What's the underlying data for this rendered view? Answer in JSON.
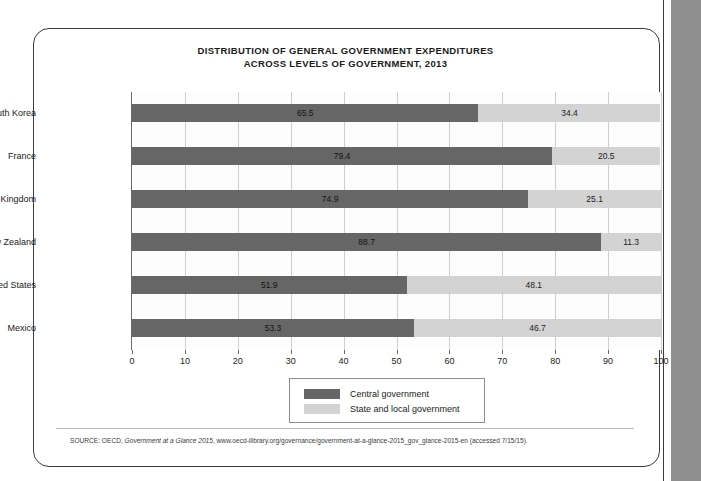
{
  "figure": {
    "title_line1": "DISTRIBUTION OF GENERAL GOVERNMENT EXPENDITURES",
    "title_line2": "ACROSS LEVELS OF GOVERNMENT, 2013",
    "source_prefix": "SOURCE: OECD, ",
    "source_italic": "Government at a Glance 2015",
    "source_rest": ", www.oecd-ilibrary.org/governance/government-at-a-glance-2015_gov_glance-2015-en (accessed 7/15/15)."
  },
  "colors": {
    "central": "#666666",
    "state_local": "#d3d3d3",
    "frame": "#3c3c3c",
    "axis": "#6a6a6a",
    "grid": "#cfcfcf",
    "page_edge": "#8f8f8f"
  },
  "legend": {
    "items": [
      {
        "label": "Central government",
        "swatch": "dark"
      },
      {
        "label": "State and local government",
        "swatch": "light"
      }
    ]
  },
  "chart_data": {
    "type": "bar",
    "orientation": "horizontal",
    "stacked": true,
    "title": "DISTRIBUTION OF GENERAL GOVERNMENT EXPENDITURES ACROSS LEVELS OF GOVERNMENT, 2013",
    "xlabel": "",
    "ylabel": "",
    "xlim": [
      0,
      100
    ],
    "xticks": [
      0,
      10,
      20,
      30,
      40,
      50,
      60,
      70,
      80,
      90,
      100
    ],
    "xtick_labels": [
      "0",
      "10",
      "20",
      "30",
      "40",
      "50",
      "60",
      "70",
      "80",
      "90",
      "100"
    ],
    "grid": true,
    "legend_position": "bottom-center",
    "categories": [
      "South Korea",
      "France",
      "United Kingdom",
      "New Zealand",
      "United States",
      "Mexico"
    ],
    "series": [
      {
        "name": "Central government",
        "color": "#666666",
        "values": [
          65.5,
          79.4,
          74.9,
          88.7,
          51.9,
          53.3
        ]
      },
      {
        "name": "State and local government",
        "color": "#d3d3d3",
        "values": [
          34.4,
          20.5,
          25.1,
          11.3,
          48.1,
          46.7
        ]
      }
    ],
    "data_labels": [
      {
        "category": "South Korea",
        "central": "65.5",
        "state_local": "34.4"
      },
      {
        "category": "France",
        "central": "79.4",
        "state_local": "20.5"
      },
      {
        "category": "United Kingdom",
        "central": "74.9",
        "state_local": "25.1"
      },
      {
        "category": "New Zealand",
        "central": "88.7",
        "state_local": "11.3"
      },
      {
        "category": "United States",
        "central": "51.9",
        "state_local": "48.1"
      },
      {
        "category": "Mexico",
        "central": "53.3",
        "state_local": "46.7"
      }
    ]
  }
}
